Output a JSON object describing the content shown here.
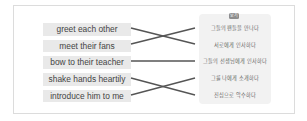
{
  "badge": {
    "label": "보기"
  },
  "english_items": [
    {
      "label": "greet each other"
    },
    {
      "label": "meet their fans"
    },
    {
      "label": "bow to their teacher"
    },
    {
      "label": "shake hands heartily"
    },
    {
      "label": "introduce him to me"
    }
  ],
  "korean_items": [
    {
      "label": "그들의 팬들을 만나다"
    },
    {
      "label": "서로에게 인사하다"
    },
    {
      "label": "그들의 선생님에게 인사하다"
    },
    {
      "label": "그를 나에게 소개하다"
    },
    {
      "label": "진심으로 악수하다"
    }
  ],
  "connections": [
    {
      "from": 0,
      "to": 1
    },
    {
      "from": 1,
      "to": 0
    },
    {
      "from": 2,
      "to": 2
    },
    {
      "from": 3,
      "to": 4
    },
    {
      "from": 4,
      "to": 3
    }
  ],
  "colors": {
    "line": "#555555",
    "item_bg": "#e9e9e9",
    "panel_bg": "#f2f2f2"
  }
}
